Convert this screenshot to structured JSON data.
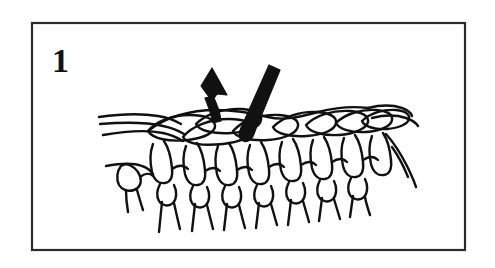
{
  "figure": {
    "kind": "instructional-line-art",
    "caption_step_label": "1",
    "background_color": "#ffffff",
    "ink_color": "#111111",
    "frame": {
      "border_color": "#2b2b2b",
      "border_width_px": 2,
      "x": 31,
      "y": 22,
      "width": 435,
      "height": 229,
      "fill": "#ffffff"
    },
    "elements": {
      "step_badge": {
        "label": "1",
        "x": 52,
        "y": 68
      },
      "hook": {
        "name": "crochet-hook",
        "fill": "#111111",
        "angle_description": "tilted from upper-right down to lower-left, entering the fabric"
      },
      "arrow": {
        "name": "direction-arrow",
        "fill": "#111111",
        "points_toward": "up-left",
        "meaning": "pull loop through in this direction"
      },
      "fabric": {
        "name": "knit-fabric",
        "top_row_loops": 8,
        "post_stitch_columns": 9,
        "loose_yarn_tails_left": 3,
        "loose_yarn_tails_right": 2
      }
    }
  }
}
